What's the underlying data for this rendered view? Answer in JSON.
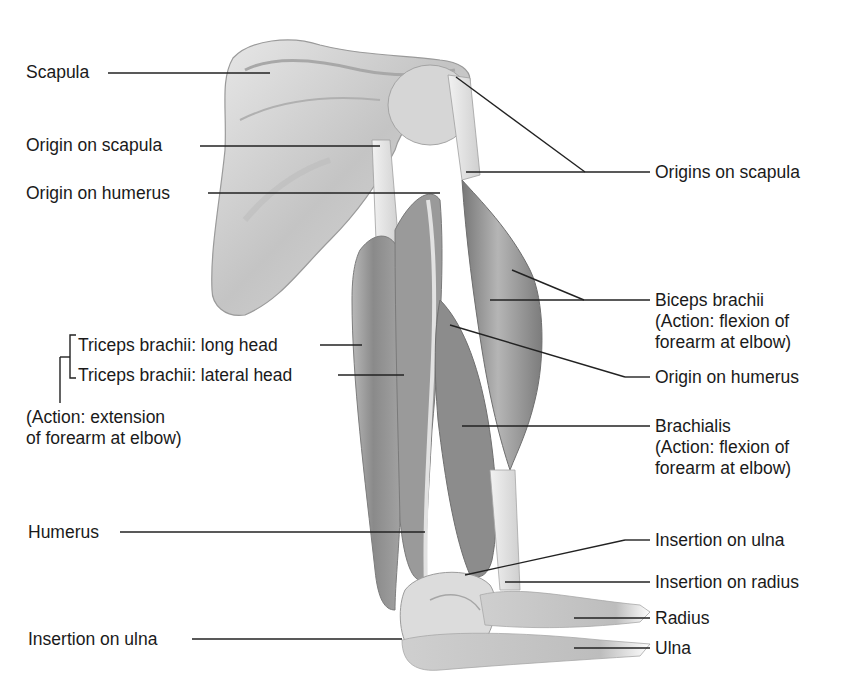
{
  "diagram": {
    "colors": {
      "text": "#1a1a1a",
      "leader_line": "#222222",
      "bone": "#d8d8d8",
      "muscle": "#8f8f8f",
      "tendon": "#e6e6e6",
      "background": "#ffffff"
    },
    "labels_left": [
      {
        "id": "scapula",
        "text": "Scapula"
      },
      {
        "id": "origin-on-scapula-left",
        "text": "Origin on scapula"
      },
      {
        "id": "origin-on-humerus-left",
        "text": "Origin on humerus"
      },
      {
        "id": "triceps-long-head",
        "text": "Triceps brachii: long head"
      },
      {
        "id": "triceps-lateral-head",
        "text": "Triceps brachii: lateral head"
      },
      {
        "id": "triceps-action",
        "line1": "(Action: extension",
        "line2": "of forearm at elbow)"
      },
      {
        "id": "humerus",
        "text": "Humerus"
      },
      {
        "id": "insertion-on-ulna-left",
        "text": "Insertion on ulna"
      }
    ],
    "labels_right": [
      {
        "id": "origins-on-scapula",
        "text": "Origins on scapula"
      },
      {
        "id": "biceps-brachii",
        "line1": "Biceps brachii",
        "line2": "(Action: flexion of",
        "line3": "forearm at elbow)"
      },
      {
        "id": "origin-on-humerus-right",
        "text": "Origin on humerus"
      },
      {
        "id": "brachialis",
        "line1": "Brachialis",
        "line2": "(Action: flexion of",
        "line3": "forearm at elbow)"
      },
      {
        "id": "insertion-on-ulna-right",
        "text": "Insertion on ulna"
      },
      {
        "id": "insertion-on-radius",
        "text": "Insertion on radius"
      },
      {
        "id": "radius",
        "text": "Radius"
      },
      {
        "id": "ulna",
        "text": "Ulna"
      }
    ]
  }
}
